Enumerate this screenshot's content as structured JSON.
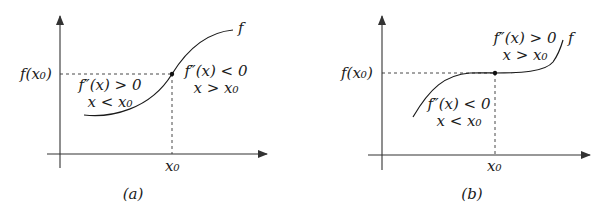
{
  "panels": [
    {
      "id": "a",
      "caption": "(a)",
      "function_label": "f",
      "y_tick_label": "f(x₀)",
      "x_tick_label": "x₀",
      "left_region": {
        "condition": "f″(x) > 0",
        "domain": "x < x₀"
      },
      "right_region": {
        "condition": "f″(x) < 0",
        "domain": "x > x₀"
      },
      "description": "Inflection point where curve changes from concave up to concave down"
    },
    {
      "id": "b",
      "caption": "(b)",
      "function_label": "f",
      "y_tick_label": "f(x₀)",
      "x_tick_label": "x₀",
      "left_region": {
        "condition": "f″(x) < 0",
        "domain": "x < x₀"
      },
      "right_region": {
        "condition": "f″(x) > 0",
        "domain": "x > x₀"
      },
      "description": "Inflection point where curve changes from concave down to concave up"
    }
  ]
}
